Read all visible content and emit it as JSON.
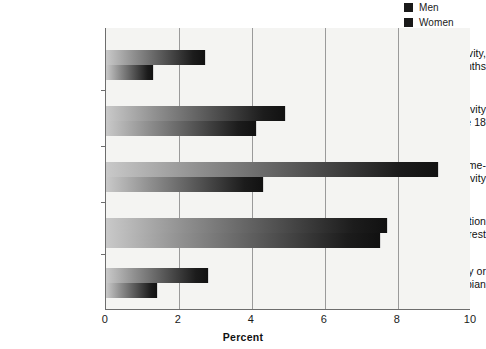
{
  "chart_data": {
    "type": "bar",
    "orientation": "horizontal",
    "title": "",
    "xlabel": "Percent",
    "ylabel": "",
    "xlim": [
      0,
      10
    ],
    "xticks": [
      0,
      2,
      4,
      6,
      8,
      10
    ],
    "xtick_labels": [
      "0",
      "2",
      "4",
      "6",
      "8",
      "10"
    ],
    "grid": "vertical",
    "legend_position": "top-right",
    "categories": [
      "Same-sex activity, last 12 months",
      "Same-sex activity since age 18",
      "Any lifetime same-sex activity",
      "Same-sex attraction or interest",
      "Consider self gay or lesbian"
    ],
    "category_lines": [
      [
        "Same-sex activity,",
        "last 12 months"
      ],
      [
        "Same-sex activity",
        "since age 18"
      ],
      [
        "Any lifetime same-",
        "sex activity"
      ],
      [
        "Same-sex attraction",
        "or interest"
      ],
      [
        "Consider self gay or",
        "lesbian"
      ]
    ],
    "series": [
      {
        "name": "Men",
        "values": [
          2.7,
          4.9,
          9.1,
          7.7,
          2.8
        ]
      },
      {
        "name": "Women",
        "values": [
          1.3,
          4.1,
          4.3,
          7.5,
          1.4
        ]
      }
    ]
  },
  "legend": {
    "items": [
      {
        "label": "Men",
        "color": "#1a1a1a"
      },
      {
        "label": "Women",
        "color": "#1a1a1a"
      }
    ]
  },
  "axis": {
    "x_title": "Percent",
    "tick_labels": [
      "0",
      "2",
      "4",
      "6",
      "8",
      "10"
    ]
  },
  "colors": {
    "plot_background": "#f4f4f2",
    "axis_line": "#6d6d6d",
    "gridline": "#9a9a9a",
    "bar_light": "#c9c9c9",
    "bar_dark": "#111111",
    "text": "#111111"
  }
}
